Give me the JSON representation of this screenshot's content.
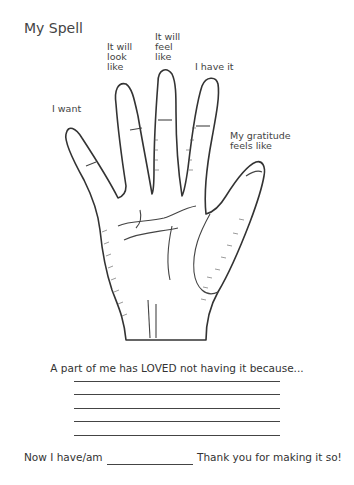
{
  "title": "My Spell",
  "labels": {
    "pinky": "I want",
    "ring": [
      "It will",
      "look",
      "like"
    ],
    "middle": [
      "It will",
      "feel",
      "like"
    ],
    "index": "I have it",
    "thumb": [
      "My gratitude",
      "feels like"
    ]
  },
  "prompt": "A part of me has LOVED not having it because...",
  "answer_lines": 5,
  "footer": {
    "left": "Now I have/am",
    "right": "Thank you for making it so!"
  },
  "illustration": "hand-drawing"
}
